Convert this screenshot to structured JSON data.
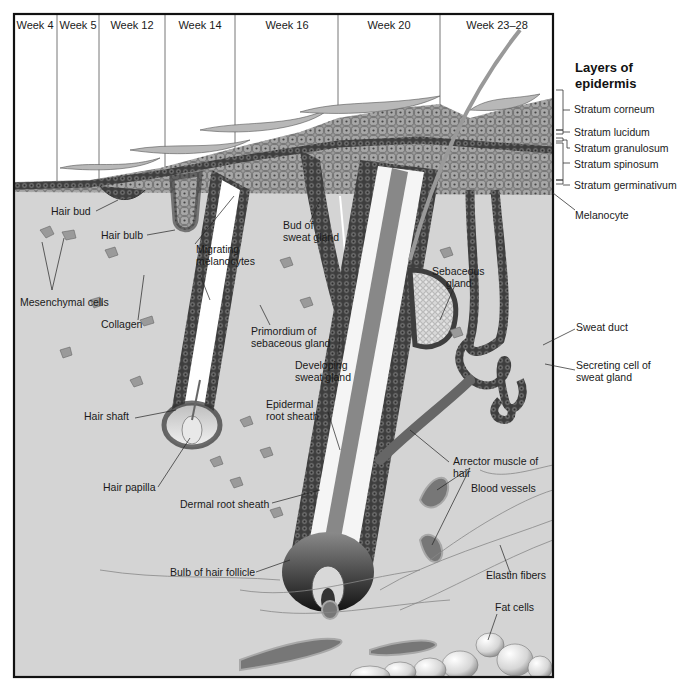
{
  "figure": {
    "title": "Layers of epidermis",
    "title_line1": "Layers of",
    "title_line2": "epidermis",
    "colors": {
      "dermis": "#d4d4d4",
      "cell_dark": "#5a5a5a",
      "cell_mid": "#8c8c8c",
      "frame": "#111111",
      "background": "#ffffff"
    }
  },
  "weeks": [
    {
      "label": "Week 4"
    },
    {
      "label": "Week 5"
    },
    {
      "label": "Week 12"
    },
    {
      "label": "Week 14"
    },
    {
      "label": "Week 16"
    },
    {
      "label": "Week 20"
    },
    {
      "label": "Week 23–28"
    }
  ],
  "epidermis_layers": [
    {
      "label": "Stratum corneum"
    },
    {
      "label": "Stratum lucidum"
    },
    {
      "label": "Stratum granulosum"
    },
    {
      "label": "Stratum spinosum"
    },
    {
      "label": "Stratum germinativum"
    }
  ],
  "labels": {
    "melanocyte": "Melanocyte",
    "hair_bud": "Hair bud",
    "hair_bulb": "Hair bulb",
    "mesenchymal_cells": "Mesenchymal cells",
    "collagen": "Collagen",
    "migrating_melanocytes_1": "Migrating",
    "migrating_melanocytes_2": "melanocytes",
    "bud_sweat_gland_1": "Bud of",
    "bud_sweat_gland_2": "sweat gland",
    "primordium_1": "Primordium of",
    "primordium_2": "sebaceous gland",
    "developing_sweat_1": "Developing",
    "developing_sweat_2": "sweat gland",
    "sebaceous_gland_1": "Sebaceous",
    "sebaceous_gland_2": "gland",
    "sweat_duct": "Sweat duct",
    "secreting_cell_1": "Secreting cell of",
    "secreting_cell_2": "sweat gland",
    "hair_shaft": "Hair shaft",
    "epidermal_root_sheath_1": "Epidermal",
    "epidermal_root_sheath_2": "root sheath",
    "hair_papilla": "Hair papilla",
    "dermal_root_sheath": "Dermal root sheath",
    "arrector_muscle_1": "Arrector muscle of",
    "arrector_muscle_2": "hair",
    "blood_vessels": "Blood vessels",
    "bulb_of_hair_follicle": "Bulb of hair follicle",
    "elastin_fibers": "Elastin fibers",
    "fat_cells": "Fat cells"
  }
}
